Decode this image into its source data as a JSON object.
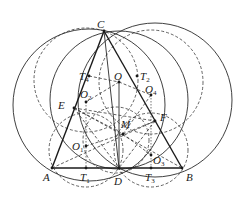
{
  "diagram": {
    "points": {
      "C": {
        "x": 104,
        "y": 31,
        "label": "C",
        "sub": "",
        "lx": 97,
        "ly": 28
      },
      "A": {
        "x": 52,
        "y": 168,
        "label": "A",
        "sub": "",
        "lx": 43,
        "ly": 181
      },
      "B": {
        "x": 182,
        "y": 168,
        "label": "B",
        "sub": "",
        "lx": 186,
        "ly": 181
      },
      "D": {
        "x": 119,
        "y": 168,
        "label": "D",
        "sub": "",
        "lx": 114,
        "ly": 185
      },
      "E": {
        "x": 74,
        "y": 108,
        "label": "E",
        "sub": "",
        "lx": 58,
        "ly": 109
      },
      "F": {
        "x": 155,
        "y": 121,
        "label": "F",
        "sub": "",
        "lx": 160,
        "ly": 121
      },
      "M": {
        "x": 123,
        "y": 134,
        "label": "M",
        "sub": "",
        "lx": 121,
        "ly": 128
      },
      "O": {
        "x": 119,
        "y": 82,
        "label": "O",
        "sub": "",
        "lx": 114,
        "ly": 80
      },
      "O1": {
        "x": 86,
        "y": 146,
        "label": "O",
        "sub": "1",
        "lx": 72,
        "ly": 150
      },
      "O2": {
        "x": 86,
        "y": 102,
        "label": "O",
        "sub": "2",
        "lx": 80,
        "ly": 98
      },
      "O3": {
        "x": 151,
        "y": 155,
        "label": "O",
        "sub": "3",
        "lx": 153,
        "ly": 164
      },
      "O4": {
        "x": 151,
        "y": 95,
        "label": "O",
        "sub": "4",
        "lx": 145,
        "ly": 93
      },
      "T1": {
        "x": 86,
        "y": 168,
        "label": "T",
        "sub": "1",
        "lx": 80,
        "ly": 181
      },
      "T2": {
        "x": 137,
        "y": 76,
        "label": "T",
        "sub": "2",
        "lx": 140,
        "ly": 80
      },
      "T3": {
        "x": 151,
        "y": 168,
        "label": "T",
        "sub": "3",
        "lx": 145,
        "ly": 181
      },
      "T4": {
        "x": 89,
        "y": 76,
        "label": "T",
        "sub": "4",
        "lx": 79,
        "ly": 80
      }
    },
    "circles_solid": [
      {
        "name": "circumcircle-ACD",
        "cx": 89,
        "cy": 105,
        "r": 76
      },
      {
        "name": "circumcircle-BCD",
        "cx": 155,
        "cy": 100,
        "r": 77
      },
      {
        "name": "circle-O-CD",
        "cx": 119,
        "cy": 100,
        "r": 69
      }
    ],
    "circles_dashed": [
      {
        "name": "circle-O2",
        "cx": 86,
        "cy": 80,
        "r": 52
      },
      {
        "name": "circle-O4",
        "cx": 151,
        "cy": 82,
        "r": 52
      },
      {
        "name": "circle-O1",
        "cx": 86,
        "cy": 150,
        "r": 37
      },
      {
        "name": "circle-O3",
        "cx": 151,
        "cy": 150,
        "r": 37
      },
      {
        "name": "circle-EMF",
        "cx": 116,
        "cy": 140,
        "r": 33
      }
    ]
  }
}
